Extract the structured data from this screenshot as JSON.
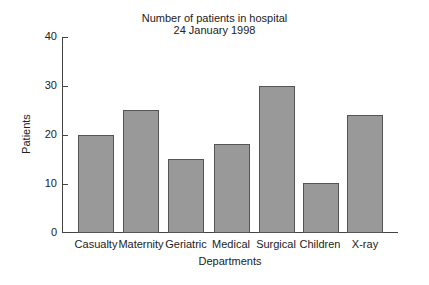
{
  "chart_data": {
    "type": "bar",
    "title": "Number of patients in hospital",
    "subtitle": "24 January 1998",
    "xlabel": "Departments",
    "ylabel": "Patients",
    "ylim": [
      0,
      40
    ],
    "yticks": [
      "0",
      "10",
      "20",
      "30",
      "40"
    ],
    "grid": false,
    "legend": null,
    "categories": [
      "Casualty",
      "Maternity",
      "Geriatric",
      "Medical",
      "Surgical",
      "Children",
      "X-ray"
    ],
    "values": [
      20,
      25,
      15,
      18,
      30,
      10,
      24
    ],
    "bar_color": "#999999"
  }
}
